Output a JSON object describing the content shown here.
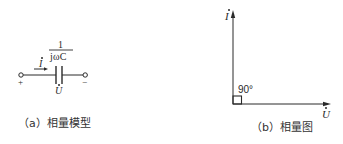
{
  "panel_a": {
    "caption": "（a）相量模型",
    "impedance_numerator": "1",
    "impedance_denominator": "jωC",
    "current_label": "I",
    "voltage_label": "U",
    "plus_sign": "+",
    "minus_sign": "−"
  },
  "panel_b": {
    "caption": "（b）相量图",
    "current_axis_label": "I",
    "voltage_axis_label": "U",
    "angle_label": "90°"
  }
}
